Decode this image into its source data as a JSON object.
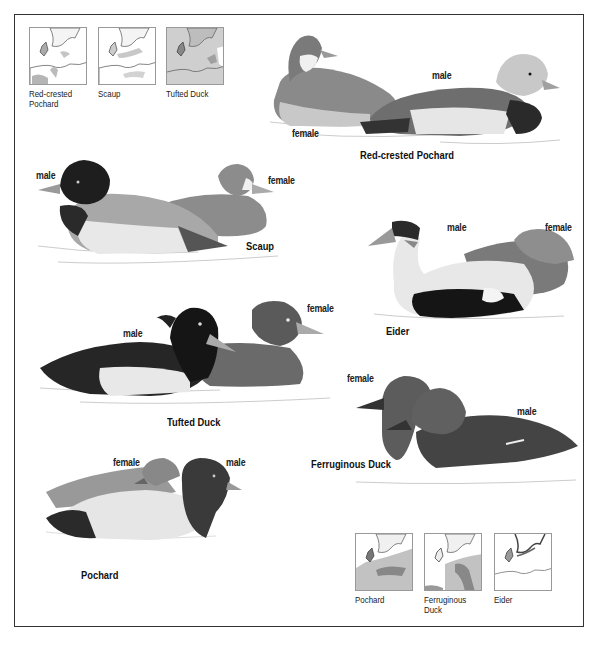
{
  "plate": {
    "maps_top": [
      {
        "id": "red-crested-pochard",
        "label": "Red-crested Pochard"
      },
      {
        "id": "scaup",
        "label": "Scaup"
      },
      {
        "id": "tufted-duck",
        "label": "Tufted Duck"
      }
    ],
    "maps_bottom": [
      {
        "id": "pochard",
        "label": "Pochard"
      },
      {
        "id": "ferruginous-duck",
        "label": "Ferruginous Duck"
      },
      {
        "id": "eider",
        "label": "Eider"
      }
    ],
    "species": [
      {
        "id": "red-crested-pochard",
        "name": "Red-crested Pochard",
        "male": "male",
        "female": "female"
      },
      {
        "id": "scaup",
        "name": "Scaup",
        "male": "male",
        "female": "female"
      },
      {
        "id": "eider",
        "name": "Eider",
        "male": "male",
        "female": "female"
      },
      {
        "id": "tufted-duck",
        "name": "Tufted Duck",
        "male": "male",
        "female": "female"
      },
      {
        "id": "ferruginous-duck",
        "name": "Ferruginous Duck",
        "male": "male",
        "female": "female"
      },
      {
        "id": "pochard",
        "name": "Pochard",
        "male": "male",
        "female": "female"
      }
    ]
  }
}
